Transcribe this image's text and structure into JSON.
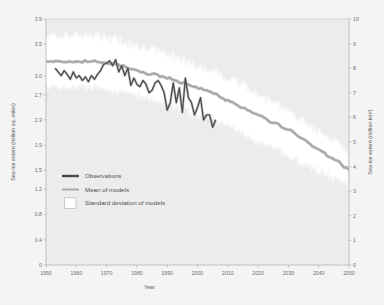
{
  "chart_data": {
    "type": "line",
    "title": "",
    "xlabel": "Year",
    "ylabel_left": "Sea-ice extent (million sq. miles)",
    "ylabel_right": "Sea-ice extent (million km²)",
    "xlim": [
      1950,
      2050
    ],
    "xticks": [
      1950,
      1960,
      1970,
      1980,
      1990,
      2000,
      2010,
      2020,
      2030,
      2040,
      2050
    ],
    "xtick_labels": [
      "1950",
      "1960",
      "1970",
      "1980",
      "1990",
      "2000",
      "2010",
      "2020",
      "2030",
      "2040",
      "2050"
    ],
    "ylim_left": [
      0,
      3.9
    ],
    "yticks_left": [
      0,
      0.4,
      0.8,
      1.2,
      1.5,
      1.9,
      2.3,
      2.7,
      3.0,
      3.5,
      3.9
    ],
    "ytick_labels_left": [
      "0",
      "0.4",
      "0.8",
      "1.2",
      "1.5",
      "1.9",
      "2.3",
      "2.7",
      "3.0",
      "3.5",
      "3.9"
    ],
    "ylim_right": [
      0,
      10
    ],
    "yticks_right": [
      0,
      1,
      2,
      3,
      4,
      5,
      6,
      7,
      8,
      9,
      10
    ],
    "ytick_labels_right": [
      "0",
      "1",
      "2",
      "3",
      "4",
      "5",
      "6",
      "7",
      "8",
      "9",
      "10"
    ],
    "grid": false,
    "legend_position": "lower-left",
    "colors": {
      "observations": "#4a4a4a",
      "model_mean": "#a8a8a8",
      "std_band": "#ffffff",
      "plot_background": "#ededed",
      "figure_background": "#f2f2f2",
      "axis": "#b3b3b3",
      "text": "#6e6e6e"
    },
    "legend": [
      {
        "label": "Observations",
        "marker": "line",
        "color": "#4a4a4a"
      },
      {
        "label": "Mean of models",
        "marker": "line",
        "color": "#a8a8a8"
      },
      {
        "label": "Standard deviation of models",
        "marker": "box",
        "color": "#ffffff"
      }
    ],
    "series": [
      {
        "name": "Observations",
        "units": "million km²",
        "x": [
          1953,
          1954,
          1955,
          1956,
          1957,
          1958,
          1959,
          1960,
          1961,
          1962,
          1963,
          1964,
          1965,
          1966,
          1967,
          1968,
          1969,
          1970,
          1971,
          1972,
          1973,
          1974,
          1975,
          1976,
          1977,
          1978,
          1979,
          1980,
          1981,
          1982,
          1983,
          1984,
          1985,
          1986,
          1987,
          1988,
          1989,
          1990,
          1991,
          1992,
          1993,
          1994,
          1995,
          1996,
          1997,
          1998,
          1999,
          2000,
          2001,
          2002,
          2003,
          2004,
          2005,
          2006
        ],
        "values": [
          8.0,
          7.85,
          7.7,
          7.9,
          7.75,
          7.55,
          7.85,
          7.6,
          7.7,
          7.5,
          7.65,
          7.45,
          7.7,
          7.55,
          7.75,
          7.9,
          8.15,
          8.2,
          8.3,
          8.1,
          8.35,
          7.85,
          8.1,
          7.7,
          8.0,
          7.3,
          7.6,
          7.35,
          7.25,
          7.5,
          7.35,
          7.0,
          7.1,
          7.4,
          7.5,
          7.3,
          7.0,
          6.3,
          6.6,
          7.4,
          6.6,
          7.2,
          6.2,
          7.6,
          6.8,
          6.6,
          6.1,
          6.4,
          6.8,
          5.9,
          6.1,
          6.1,
          5.6,
          5.9
        ]
      },
      {
        "name": "Mean of models",
        "units": "million km²",
        "x": [
          1950,
          1955,
          1960,
          1965,
          1970,
          1975,
          1980,
          1985,
          1990,
          1995,
          2000,
          2005,
          2010,
          2015,
          2020,
          2025,
          2030,
          2035,
          2040,
          2045,
          2050
        ],
        "values": [
          8.3,
          8.25,
          8.25,
          8.3,
          8.2,
          8.1,
          7.9,
          7.75,
          7.6,
          7.4,
          7.2,
          7.0,
          6.7,
          6.4,
          6.1,
          5.8,
          5.5,
          5.1,
          4.7,
          4.3,
          3.9
        ]
      },
      {
        "name": "Standard deviation of models (upper)",
        "units": "million km²",
        "x": [
          1950,
          1955,
          1960,
          1965,
          1970,
          1975,
          1980,
          1985,
          1990,
          1995,
          2000,
          2005,
          2010,
          2015,
          2020,
          2025,
          2030,
          2035,
          2040,
          2045,
          2050
        ],
        "values": [
          9.3,
          9.35,
          9.3,
          9.35,
          9.25,
          9.1,
          8.9,
          8.75,
          8.55,
          8.35,
          8.1,
          7.9,
          7.6,
          7.3,
          6.95,
          6.6,
          6.25,
          5.85,
          5.4,
          5.0,
          4.5
        ]
      },
      {
        "name": "Standard deviation of models (lower)",
        "units": "million km²",
        "x": [
          1950,
          1955,
          1960,
          1965,
          1970,
          1975,
          1980,
          1985,
          1990,
          1995,
          2000,
          2005,
          2010,
          2015,
          2020,
          2025,
          2030,
          2035,
          2040,
          2045,
          2050
        ],
        "values": [
          7.3,
          7.2,
          7.2,
          7.2,
          7.1,
          7.0,
          6.85,
          6.7,
          6.5,
          6.3,
          6.1,
          5.9,
          5.6,
          5.3,
          5.0,
          4.7,
          4.4,
          4.1,
          3.8,
          3.5,
          3.3
        ]
      }
    ]
  }
}
